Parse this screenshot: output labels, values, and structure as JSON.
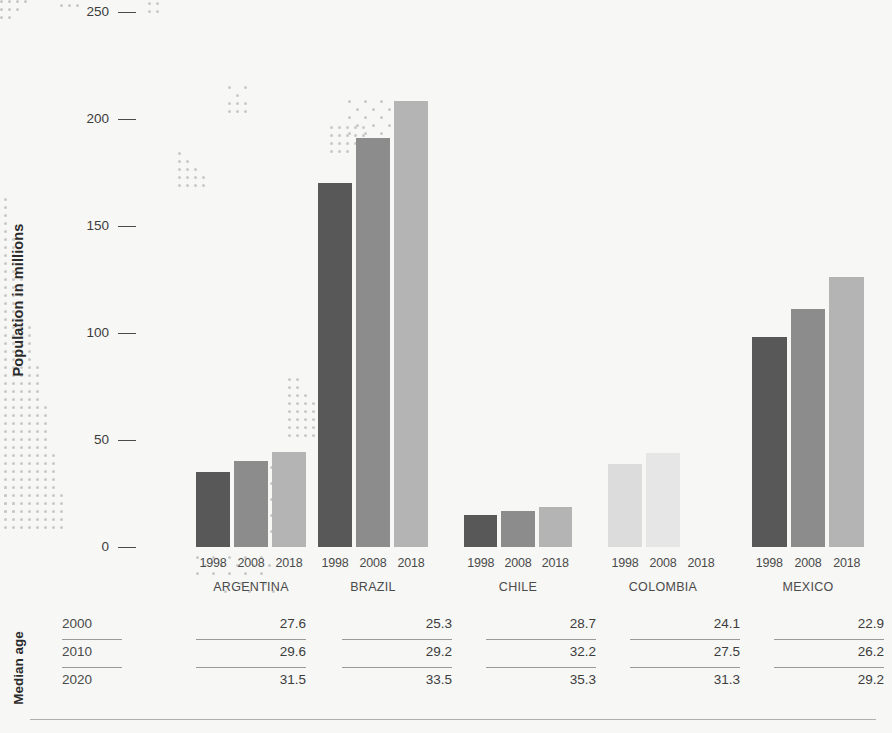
{
  "chart_data": {
    "type": "bar",
    "title": "",
    "xlabel": "",
    "ylabel": "Population in millions",
    "ylim": [
      0,
      250
    ],
    "yticks": [
      0,
      50,
      100,
      150,
      200,
      250
    ],
    "grid": false,
    "legend": "none",
    "categories": [
      "ARGENTINA",
      "BRAZIL",
      "CHILE",
      "COLOMBIA",
      "MEXICO"
    ],
    "series": [
      {
        "name": "1998",
        "values": [
          35.0,
          170.0,
          15.0,
          39.0,
          98.0
        ]
      },
      {
        "name": "2008",
        "values": [
          40.0,
          191.0,
          17.0,
          44.0,
          111.0
        ]
      },
      {
        "name": "2018",
        "values": [
          44.5,
          208.5,
          18.8,
          null,
          126.0
        ]
      }
    ],
    "table": {
      "title": "Median age",
      "row_labels": [
        "2000",
        "2010",
        "2020"
      ],
      "columns": [
        "ARGENTINA",
        "BRAZIL",
        "CHILE",
        "COLOMBIA",
        "MEXICO"
      ],
      "rows": [
        [
          "27.6",
          "25.3",
          "28.7",
          "24.1",
          "22.9"
        ],
        [
          "29.6",
          "29.2",
          "32.2",
          "27.5",
          "26.2"
        ],
        [
          "31.5",
          "33.5",
          "35.3",
          "31.3",
          "29.2"
        ]
      ]
    }
  },
  "axis": {
    "y_label": "Population in millions",
    "ticks": [
      "250",
      "200",
      "150",
      "100",
      "50",
      "0"
    ]
  },
  "groups": [
    {
      "name": "ARGENTINA",
      "years": [
        "1998",
        "2008",
        "2018"
      ],
      "values": [
        "35.0",
        "40.0",
        "44.5"
      ]
    },
    {
      "name": "BRAZIL",
      "years": [
        "1998",
        "2008",
        "2018"
      ],
      "values": [
        "170.0",
        "191.0",
        "208.5"
      ]
    },
    {
      "name": "CHILE",
      "years": [
        "1998",
        "2008",
        "2018"
      ],
      "values": [
        "15.0",
        "17.0",
        "18.8"
      ]
    },
    {
      "name": "COLOMBIA",
      "years": [
        "1998",
        "2008",
        "2018"
      ],
      "values": [
        "39.0",
        "44.0",
        ""
      ]
    },
    {
      "name": "MEXICO",
      "years": [
        "1998",
        "2008",
        "2018"
      ],
      "values": [
        "98.0",
        "111.0",
        "126.0"
      ]
    }
  ],
  "median": {
    "title": "Median age",
    "rows": [
      {
        "label": "2000",
        "cells": [
          "27.6",
          "25.3",
          "28.7",
          "24.1",
          "22.9"
        ]
      },
      {
        "label": "2010",
        "cells": [
          "29.6",
          "29.2",
          "32.2",
          "27.5",
          "26.2"
        ]
      },
      {
        "label": "2020",
        "cells": [
          "31.5",
          "33.5",
          "35.3",
          "31.3",
          "29.2"
        ]
      }
    ]
  },
  "colors": {
    "background": "#f7f7f5",
    "bar_1998": "#585858",
    "bar_2008": "#8c8c8c",
    "bar_2018": "#b4b4b4",
    "bar_1998_muted": "#dcdcdc",
    "bar_2008_muted": "#e6e6e6",
    "text": "#3c3c3c",
    "rule": "#9a9a9a"
  }
}
